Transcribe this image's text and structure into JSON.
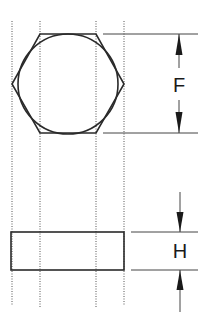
{
  "diagram": {
    "colors": {
      "line": "#2a2a2a",
      "construction": "#555555",
      "background": "#ffffff"
    },
    "views": [
      {
        "name": "top-view",
        "shape": "hexagon with inscribed circle"
      },
      {
        "name": "side-view",
        "shape": "rectangle"
      }
    ],
    "dimensions": [
      {
        "id": "F",
        "label": "F",
        "meaning": "width across flats"
      },
      {
        "id": "H",
        "label": "H",
        "meaning": "height"
      }
    ]
  }
}
